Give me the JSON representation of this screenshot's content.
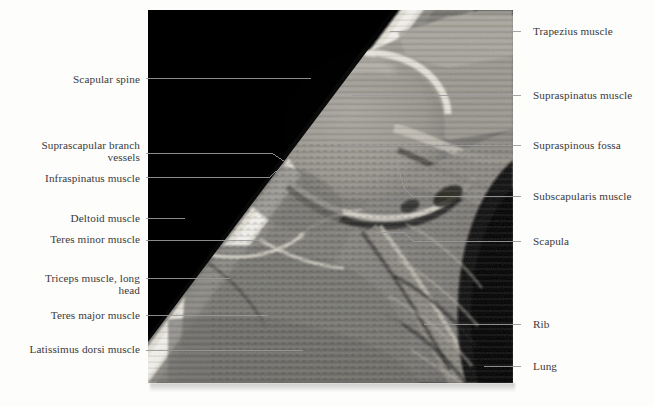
{
  "figure": {
    "modality": "MRI",
    "view": "oblique coronal section of the shoulder",
    "image_box": {
      "x": 148,
      "y": 10,
      "width": 365,
      "height": 373
    },
    "background_color": "#fdfdfc",
    "image_background_color": "#000000",
    "label_color": "#3b3a39",
    "leader_color": "#9a9a9a"
  },
  "labels": {
    "left": [
      {
        "name": "scapular-spine",
        "text": "Scapular spine",
        "text_right": 140,
        "text_baseline_y": 82,
        "leader": [
          [
            146,
            78
          ],
          [
            311,
            78
          ]
        ]
      },
      {
        "name": "suprascapular-branch-vessels",
        "text": "Suprascapular branch\nvessels",
        "text_right": 140,
        "text_baseline_y": 148,
        "leader": [
          [
            146,
            153
          ],
          [
            262,
            153
          ],
          [
            272,
            153
          ],
          [
            285,
            162
          ]
        ]
      },
      {
        "name": "infraspinatus-muscle",
        "text": "Infraspinatus muscle",
        "text_right": 140,
        "text_baseline_y": 181,
        "leader": [
          [
            146,
            177
          ],
          [
            260,
            177
          ],
          [
            270,
            177
          ],
          [
            283,
            165
          ]
        ]
      },
      {
        "name": "deltoid-muscle",
        "text": "Deltoid muscle",
        "text_right": 140,
        "text_baseline_y": 221,
        "leader": [
          [
            146,
            218
          ],
          [
            185,
            218
          ]
        ]
      },
      {
        "name": "teres-minor-muscle",
        "text": "Teres minor muscle",
        "text_right": 140,
        "text_baseline_y": 242,
        "leader": [
          [
            146,
            240
          ],
          [
            260,
            240
          ]
        ]
      },
      {
        "name": "triceps-muscle-long-head",
        "text": "Triceps muscle, long\nhead",
        "text_right": 140,
        "text_baseline_y": 281,
        "leader": [
          [
            146,
            278
          ],
          [
            230,
            278
          ]
        ]
      },
      {
        "name": "teres-major-muscle",
        "text": "Teres major muscle",
        "text_right": 140,
        "text_baseline_y": 318,
        "leader": [
          [
            146,
            315
          ],
          [
            268,
            315
          ]
        ]
      },
      {
        "name": "latissimus-dorsi-muscle",
        "text": "Latissimus dorsi muscle",
        "text_right": 140,
        "text_baseline_y": 352,
        "leader": [
          [
            146,
            350
          ],
          [
            303,
            350
          ]
        ]
      }
    ],
    "right": [
      {
        "name": "trapezius-muscle",
        "text": "Trapezius muscle",
        "text_left": 533,
        "text_baseline_y": 34,
        "leader": [
          [
            521,
            31
          ],
          [
            390,
            31
          ]
        ]
      },
      {
        "name": "supraspinatus-muscle",
        "text": "Supraspinatus muscle",
        "text_left": 533,
        "text_baseline_y": 98,
        "leader": [
          [
            521,
            95
          ],
          [
            352,
            95
          ]
        ]
      },
      {
        "name": "supraspinous-fossa",
        "text": "Supraspinous fossa",
        "text_left": 533,
        "text_baseline_y": 148,
        "leader": [
          [
            521,
            145
          ],
          [
            345,
            145
          ]
        ]
      },
      {
        "name": "subscapularis-muscle",
        "text": "Subscapularis muscle",
        "text_left": 533,
        "text_baseline_y": 199,
        "leader": [
          [
            521,
            196
          ],
          [
            412,
            196
          ],
          [
            404,
            188
          ],
          [
            396,
            160
          ]
        ]
      },
      {
        "name": "scapula",
        "text": "Scapula",
        "text_left": 533,
        "text_baseline_y": 244,
        "leader": [
          [
            521,
            241
          ],
          [
            413,
            241
          ],
          [
            404,
            232
          ],
          [
            376,
            232
          ]
        ]
      },
      {
        "name": "rib",
        "text": "Rib",
        "text_left": 533,
        "text_baseline_y": 327,
        "leader": [
          [
            521,
            324
          ],
          [
            424,
            324
          ]
        ]
      },
      {
        "name": "lung",
        "text": "Lung",
        "text_left": 533,
        "text_baseline_y": 369,
        "leader": [
          [
            521,
            366
          ],
          [
            484,
            366
          ]
        ]
      }
    ]
  }
}
